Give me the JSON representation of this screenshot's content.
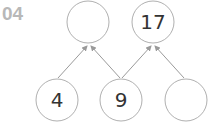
{
  "problem_number": "04",
  "top_row": [
    {
      "value": ""
    },
    {
      "value": "17"
    }
  ],
  "bottom_row": [
    {
      "value": "4"
    },
    {
      "value": "9"
    },
    {
      "value": ""
    }
  ],
  "colors": {
    "circle_stroke": "#b0b0b0",
    "arrow": "#9a9a9a",
    "number_text": "#333333",
    "problem_number": "#b8b8b8"
  }
}
